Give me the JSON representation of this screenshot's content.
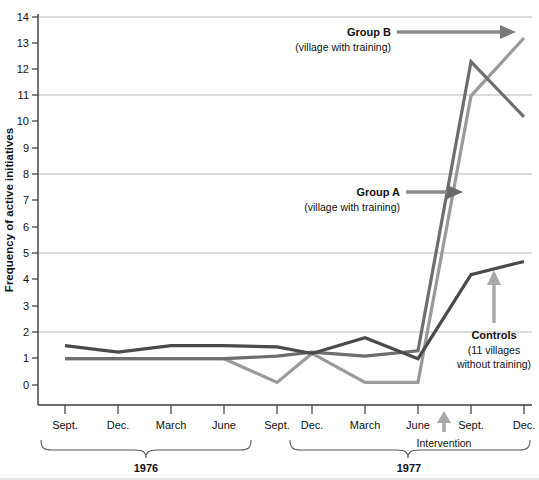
{
  "chart_data": {
    "type": "line",
    "title": "",
    "xlabel": "",
    "ylabel": "Frequency of active initiatives",
    "ylim": [
      0,
      14
    ],
    "yticks": [
      0,
      1,
      2,
      3,
      4,
      5,
      6,
      7,
      8,
      9,
      10,
      11,
      12,
      13,
      14
    ],
    "gridlines_at": [
      2,
      5,
      8,
      11,
      14
    ],
    "grid": true,
    "legend_position": "inline-annotations",
    "x": [
      "Sept.",
      "Dec.",
      "March",
      "June",
      "Sept.",
      "Dec.",
      "March",
      "June",
      "Sept.",
      "Dec."
    ],
    "x_groups": [
      {
        "label": "1976",
        "start_index": 0,
        "end_index": 5
      },
      {
        "label": "1977",
        "start_index": 6,
        "end_index": 9
      }
    ],
    "series": [
      {
        "name": "Controls",
        "sublabel": "(11 villages without training)",
        "color": "#4a4a4a",
        "values": [
          1.5,
          1.25,
          1.5,
          1.5,
          1.45,
          1.2,
          1.8,
          1.0,
          4.2,
          4.7
        ]
      },
      {
        "name": "Group A",
        "sublabel": "(village with training)",
        "color": "#6e6e6e",
        "values": [
          1.0,
          1.0,
          1.0,
          1.0,
          1.1,
          1.25,
          1.1,
          1.3,
          12.3,
          10.2
        ]
      },
      {
        "name": "Group B",
        "sublabel": "(village with training)",
        "color": "#9a9a9a",
        "values": [
          1.0,
          1.0,
          1.0,
          1.0,
          0.1,
          1.2,
          0.1,
          0.1,
          11.0,
          13.2
        ]
      }
    ],
    "annotations": [
      {
        "id": "group-b",
        "title": "Group B",
        "subtitle": "(village with training)",
        "arrow": "right"
      },
      {
        "id": "group-a",
        "title": "Group A",
        "subtitle": "(village with training)",
        "arrow": "right"
      },
      {
        "id": "controls",
        "title": "Controls",
        "subtitle_line1": "(11 villages",
        "subtitle_line2": "without training)",
        "arrow": "up"
      },
      {
        "id": "intervention",
        "title": "Intervention",
        "arrow": "up"
      }
    ],
    "colors": {
      "grid": "#b9b9b9",
      "axis": "#3a3a3a",
      "controls": "#4a4a4a",
      "group_a": "#6e6e6e",
      "group_b": "#9a9a9a"
    }
  }
}
